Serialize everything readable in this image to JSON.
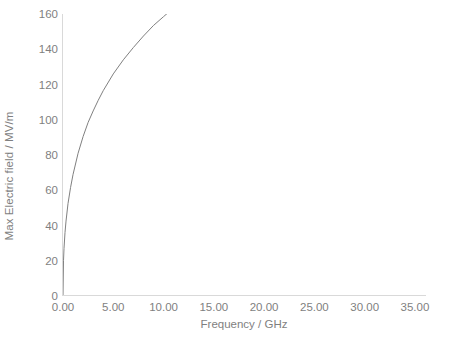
{
  "chart_data": {
    "type": "line",
    "title": "",
    "xlabel": "Frequency / GHz",
    "ylabel": "Max Electric field / MV/m",
    "xlim": [
      0,
      36
    ],
    "ylim": [
      0,
      160
    ],
    "grid": false,
    "legend": false,
    "legend_position": "none",
    "line_color": "#808080",
    "axis_color": "#d9d9d9",
    "text_color": "#7f7f7f",
    "x_ticks": [
      0,
      5,
      10,
      15,
      20,
      25,
      30,
      35
    ],
    "x_tick_labels": [
      "0.00",
      "5.00",
      "10.00",
      "15.00",
      "20.00",
      "25.00",
      "30.00",
      "35.00"
    ],
    "y_ticks": [
      0,
      20,
      40,
      60,
      80,
      100,
      120,
      140,
      160
    ],
    "y_tick_labels": [
      "0",
      "20",
      "40",
      "60",
      "80",
      "100",
      "120",
      "140",
      "160"
    ],
    "series": [
      {
        "name": "Max Electric field",
        "x": [
          0.0,
          0.05,
          0.1,
          0.2,
          0.3,
          0.5,
          0.75,
          1.0,
          1.5,
          2.0,
          2.5,
          3.0,
          3.5,
          4.0,
          5.0,
          6.0,
          7.0,
          8.0,
          9.0,
          10.0,
          11.0,
          12.0,
          13.0,
          14.0,
          15.0,
          16.0,
          17.0,
          18.0,
          19.0,
          20.0,
          21.0,
          22.0,
          23.0,
          24.0,
          25.0,
          26.0,
          27.0,
          28.0,
          29.0,
          30.0,
          31.0,
          32.0,
          33.0,
          34.0,
          35.0,
          36.0
        ],
        "y": [
          0.0,
          9.6,
          12.7,
          16.7,
          19.6,
          24.1,
          28.3,
          31.8,
          37.6,
          42.0,
          45.7,
          48.9,
          51.7,
          54.3,
          58.7,
          62.6,
          65.9,
          68.9,
          71.7,
          74.2,
          76.5,
          78.7,
          80.8,
          82.7,
          84.5,
          86.3,
          88.0,
          89.6,
          91.1,
          92.6,
          94.0,
          95.4,
          96.7,
          98.0,
          99.2,
          100.4,
          101.6,
          102.8,
          103.9,
          105.0,
          106.1,
          107.1,
          108.1,
          109.1,
          110.1,
          111.0
        ]
      }
    ],
    "series_display_y": [
      0.0,
      20.0,
      27.0,
      36.0,
      42.5,
      52.5,
      61.5,
      69.0,
      81.0,
      90.5,
      98.5,
      105.0,
      111.0,
      116.5,
      126.0,
      134.0,
      141.0,
      147.5,
      153.5,
      158.5,
      163.5,
      168.0,
      172.5,
      176.5,
      180.5,
      184.0,
      187.5,
      190.5,
      194.0,
      197.0,
      200.0,
      203.0,
      205.5,
      208.0,
      210.5,
      213.0,
      215.5,
      218.0,
      220.0,
      222.5,
      224.5,
      226.5,
      228.5,
      230.5,
      232.5,
      234.5
    ]
  }
}
